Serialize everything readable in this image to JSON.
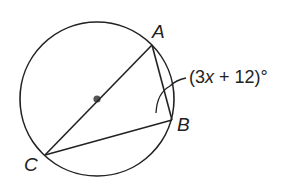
{
  "figure": {
    "type": "inscribed-angle-diagram",
    "circle": {
      "center": [
        97,
        99
      ],
      "radius": 77,
      "center_marked": true
    },
    "points": {
      "A": {
        "label": "A",
        "x": 152,
        "y": 45
      },
      "B": {
        "label": "B",
        "x": 172,
        "y": 120
      },
      "C": {
        "label": "C",
        "x": 45,
        "y": 155
      }
    },
    "segments": [
      "AC",
      "AB",
      "BC"
    ],
    "diameter": "AC",
    "marked_angle": {
      "vertex": "B",
      "expression_prefix": "(3",
      "expression_var": "x",
      "expression_suffix": " + 12)°",
      "full_text": "(3x + 12)°"
    },
    "colors": {
      "stroke": "#222222",
      "background": "#ffffff"
    }
  }
}
